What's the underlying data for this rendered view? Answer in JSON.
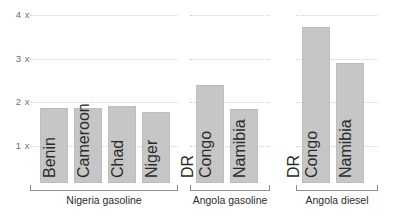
{
  "chart_data": {
    "type": "bar",
    "title": "",
    "xlabel": "",
    "ylabel": "",
    "ylim": [
      0,
      4.2
    ],
    "grid": true,
    "legend_position": "none",
    "y_ticks": [
      {
        "value": 4,
        "label": "4 x"
      },
      {
        "value": 3,
        "label": "3 x"
      },
      {
        "value": 2,
        "label": "2 x"
      },
      {
        "value": 1,
        "label": "1 x"
      }
    ],
    "groups": [
      {
        "label": "Nigeria gasoline",
        "categories": [
          "Benin",
          "Cameroon",
          "Chad",
          "Niger"
        ],
        "values": [
          1.87,
          1.87,
          1.92,
          1.78
        ]
      },
      {
        "label": "Angola gasoline",
        "categories": [
          "DR Congo",
          "Namibia"
        ],
        "values": [
          2.4,
          1.85
        ]
      },
      {
        "label": "Angola diesel",
        "categories": [
          "DR Congo",
          "Namibia"
        ],
        "values": [
          3.72,
          2.9
        ]
      }
    ],
    "colors": {
      "bar_fill": "#c6c6c6",
      "bar_stroke": "#bdbdbd",
      "gridline": "#d3d3d3",
      "tick_text": "#6f6f6f",
      "label_text": "#2b2b2b"
    }
  }
}
